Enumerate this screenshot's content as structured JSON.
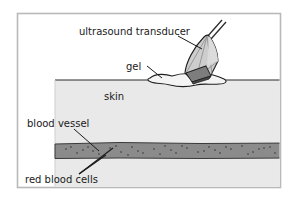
{
  "figure": {
    "type": "labeled-anatomical-diagram",
    "canvas": {
      "width": 296,
      "height": 200,
      "background": "#ffffff"
    },
    "frame": {
      "x": 17,
      "y": 13,
      "width": 264,
      "height": 175,
      "border_color": "#b9b9b9",
      "fill": "#ffffff"
    }
  },
  "labels": {
    "transducer": "ultrasound transducer",
    "gel": "gel",
    "skin": "skin",
    "vessel": "blood vessel",
    "cells": "red blood cells"
  },
  "colors": {
    "skin_fill": "#e9e9e9",
    "vessel_fill": "#8b8b8b",
    "vessel_dot": "#5c5c5c",
    "transducer_fill": "#c6c6c6",
    "transducer_facet": "#d8d8d8",
    "transducer_tip_band": "#7a7a7a",
    "gel_fill": "#f2f2f2",
    "outline": "#1a1a1a",
    "text": "#1a1a1a"
  },
  "layers": [
    {
      "name": "skin",
      "label": "skin",
      "fill": "#e9e9e9",
      "top_y": 80,
      "bottom_y": 188
    },
    {
      "name": "blood-vessel",
      "label": "blood vessel",
      "fill": "#8b8b8b",
      "top_y": 143,
      "bottom_y": 158
    }
  ],
  "annotations": [
    {
      "name": "transducer",
      "text": "ultrasound transducer",
      "text_x": 79,
      "text_y": 32,
      "leader_from_x": 177,
      "leader_from_y": 35,
      "leader_to_x": 201,
      "leader_to_y": 48
    },
    {
      "name": "gel",
      "text": "gel",
      "text_x": 126,
      "text_y": 70,
      "leader_from_x": 146,
      "leader_from_y": 66,
      "leader_to_x": 160,
      "leader_to_y": 78
    },
    {
      "name": "skin",
      "text": "skin",
      "text_x": 104,
      "text_y": 99
    },
    {
      "name": "blood-vessel",
      "text": "blood vessel",
      "text_x": 27,
      "text_y": 125,
      "leader_from_x": 73,
      "leader_from_y": 129,
      "leader_to_x": 98,
      "leader_to_y": 152
    },
    {
      "name": "red-blood-cells",
      "text": "red blood cells",
      "text_x": 25,
      "text_y": 181,
      "leader_from_x": 79,
      "leader_from_y": 172,
      "leader_to_x": 112,
      "leader_to_y": 150
    }
  ],
  "red_blood_cell_dots": [
    [
      66,
      149
    ],
    [
      77,
      153
    ],
    [
      88,
      147
    ],
    [
      99,
      154
    ],
    [
      110,
      148
    ],
    [
      121,
      152
    ],
    [
      132,
      147
    ],
    [
      143,
      153
    ],
    [
      154,
      149
    ],
    [
      165,
      146
    ],
    [
      176,
      153
    ],
    [
      187,
      148
    ],
    [
      198,
      152
    ],
    [
      209,
      147
    ],
    [
      220,
      153
    ],
    [
      231,
      149
    ],
    [
      242,
      146
    ],
    [
      253,
      152
    ],
    [
      264,
      148
    ],
    [
      275,
      153
    ],
    [
      71,
      147
    ],
    [
      93,
      151
    ],
    [
      116,
      146
    ],
    [
      138,
      151
    ],
    [
      160,
      154
    ],
    [
      182,
      146
    ],
    [
      204,
      151
    ],
    [
      226,
      147
    ],
    [
      248,
      154
    ],
    [
      270,
      147
    ]
  ]
}
